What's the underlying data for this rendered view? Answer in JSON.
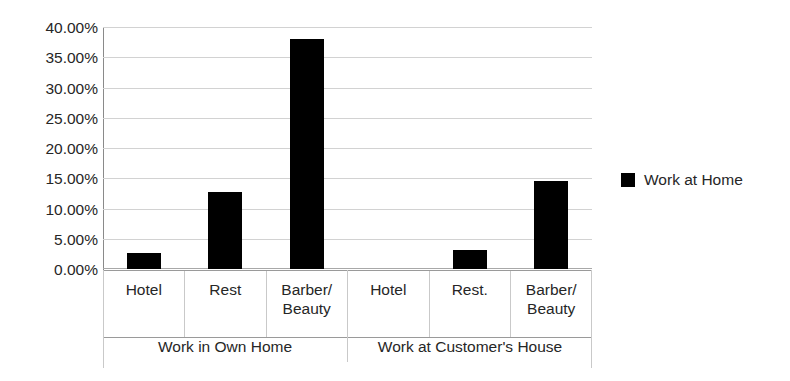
{
  "chart_data": {
    "type": "bar",
    "title": "",
    "xlabel": "",
    "ylabel": "",
    "ylim": [
      0,
      40
    ],
    "ytick_labels": [
      "40.00%",
      "35.00%",
      "30.00%",
      "25.00%",
      "20.00%",
      "15.00%",
      "10.00%",
      "5.00%",
      "0.00%"
    ],
    "ytick_values": [
      40,
      35,
      30,
      25,
      20,
      15,
      10,
      5,
      0
    ],
    "grid": true,
    "legend_position": "right",
    "categories": [
      "Hotel",
      "Rest",
      "Barber/\nBeauty",
      "Hotel",
      "Rest.",
      "Barber/\nBeauty"
    ],
    "groups": [
      {
        "label": "Work in Own Home",
        "categories": [
          "Hotel",
          "Rest",
          "Barber/ Beauty"
        ]
      },
      {
        "label": "Work at Customer's House",
        "categories": [
          "Hotel",
          "Rest.",
          "Barber/ Beauty"
        ]
      }
    ],
    "series": [
      {
        "name": "Work at Home",
        "color": "#000000",
        "values": [
          2.6,
          12.7,
          38.0,
          0.0,
          3.1,
          14.5
        ]
      }
    ]
  },
  "legend": {
    "items": [
      {
        "label": "Work at Home",
        "color": "#000000",
        "marker": "filled-square"
      }
    ]
  },
  "axis": {
    "cat_labels": [
      {
        "line1": "Hotel",
        "line2": ""
      },
      {
        "line1": "Rest",
        "line2": ""
      },
      {
        "line1": "Barber/",
        "line2": "Beauty"
      },
      {
        "line1": "Hotel",
        "line2": ""
      },
      {
        "line1": "Rest.",
        "line2": ""
      },
      {
        "line1": "Barber/",
        "line2": "Beauty"
      }
    ],
    "group_labels": [
      "Work in Own Home",
      "Work at Customer's House"
    ]
  },
  "colors": {
    "bar": "#000000",
    "gridline": "#d2d2d2",
    "axis": "#8a8a8a",
    "text": "#262626",
    "background": "#ffffff"
  }
}
